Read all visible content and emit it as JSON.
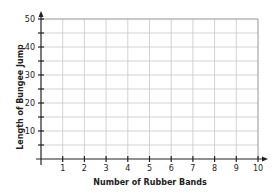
{
  "chart_data": {
    "type": "line",
    "title": "",
    "xlabel": "Number of Rubber Bands",
    "ylabel": "Length of Bungee Jump",
    "xlim": [
      0,
      10
    ],
    "ylim": [
      0,
      50
    ],
    "x_ticks": [
      "1",
      "2",
      "3",
      "4",
      "5",
      "6",
      "7",
      "8",
      "9",
      "10"
    ],
    "y_ticks": [
      "10",
      "20",
      "30",
      "40",
      "50"
    ],
    "y_minor_step": 5,
    "grid": true,
    "series": [],
    "legend": null
  },
  "colors": {
    "axis": "#222222",
    "grid": "#c8c8c8"
  }
}
